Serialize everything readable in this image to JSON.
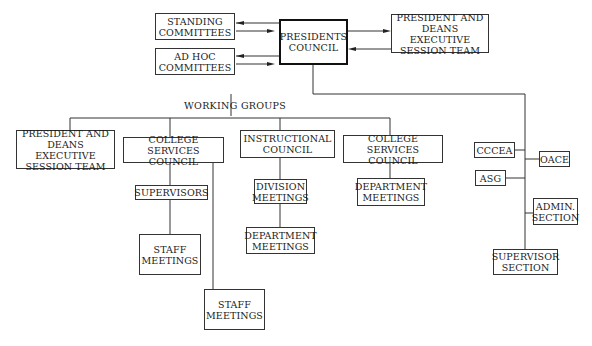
{
  "diagram": {
    "type": "organizational-chart",
    "nodes": {
      "standing_committees": "STANDING\nCOMMITTEES",
      "ad_hoc_committees": "AD  HOC\nCOMMITTEES",
      "presidents_council": "PRESIDENTS\nCOUNCIL",
      "president_deans_top": "PRESIDENT  AND\nDEANS  EXECUTIVE\nSESSION  TEAM",
      "working_groups_label": "WORKING  GROUPS",
      "president_deans_wg": "PRESIDENT  AND\nDEANS  EXECUTIVE\nSESSION  TEAM",
      "college_services_council_1": "COLLEGE\nSERVICES  COUNCIL",
      "supervisors": "SUPERVISORS",
      "staff_meetings_1": "STAFF\nMEETINGS",
      "staff_meetings_2": "STAFF\nMEETINGS",
      "instructional_council": "INSTRUCTIONAL\nCOUNCIL",
      "division_meetings": "DIVISION\nMEETINGS",
      "department_meetings_1": "DEPARTMENT\nMEETINGS",
      "college_services_council_2": "COLLEGE\nSERVICES  COUNCIL",
      "department_meetings_2": "DEPARTMENT\nMEETINGS",
      "cccea": "CCCEA",
      "oace": "OACE",
      "asg": "ASG",
      "admin_section": "ADMIN.\nSECTION",
      "supervisor_section": "SUPERVISOR\nSECTION"
    },
    "edges": [
      {
        "from": "presidents_council",
        "to": "standing_committees",
        "type": "bidirectional"
      },
      {
        "from": "presidents_council",
        "to": "ad_hoc_committees",
        "type": "bidirectional"
      },
      {
        "from": "presidents_council",
        "to": "president_deans_top",
        "type": "bidirectional"
      },
      {
        "from": "presidents_council",
        "to": "working_groups_label"
      },
      {
        "from": "working_groups_label",
        "to": "president_deans_wg"
      },
      {
        "from": "working_groups_label",
        "to": "college_services_council_1"
      },
      {
        "from": "working_groups_label",
        "to": "instructional_council"
      },
      {
        "from": "working_groups_label",
        "to": "college_services_council_2"
      },
      {
        "from": "college_services_council_1",
        "to": "supervisors"
      },
      {
        "from": "supervisors",
        "to": "staff_meetings_1"
      },
      {
        "from": "college_services_council_1",
        "to": "staff_meetings_2"
      },
      {
        "from": "instructional_council",
        "to": "division_meetings"
      },
      {
        "from": "division_meetings",
        "to": "department_meetings_1"
      },
      {
        "from": "college_services_council_2",
        "to": "department_meetings_2"
      },
      {
        "from": "presidents_council",
        "to": "cccea"
      },
      {
        "from": "presidents_council",
        "to": "oace"
      },
      {
        "from": "presidents_council",
        "to": "asg"
      },
      {
        "from": "presidents_council",
        "to": "admin_section"
      },
      {
        "from": "presidents_council",
        "to": "supervisor_section"
      }
    ]
  }
}
